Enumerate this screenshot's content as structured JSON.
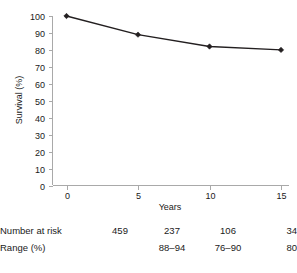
{
  "chart_data": {
    "type": "line",
    "title": "",
    "xlabel": "Years",
    "ylabel": "Survival (%)",
    "x": [
      0,
      5,
      10,
      15
    ],
    "values": [
      100,
      89,
      82,
      80
    ],
    "series": [
      {
        "name": "Survival",
        "values": [
          100,
          89,
          82,
          80
        ]
      }
    ],
    "xlim": [
      0,
      15
    ],
    "ylim": [
      0,
      100
    ],
    "xticks": [
      0,
      5,
      10,
      15
    ],
    "xtick_labels": [
      "0",
      "5",
      "10",
      "15"
    ],
    "yticks": [
      0,
      10,
      20,
      30,
      40,
      50,
      60,
      70,
      80,
      90,
      100
    ],
    "ytick_labels": [
      "0",
      "10",
      "20",
      "30",
      "40",
      "50",
      "60",
      "70",
      "80",
      "90",
      "100"
    ],
    "grid": false,
    "legend": "none",
    "marker": "diamond",
    "line_color": "#231f20",
    "axis_color": "#a9a9a9"
  },
  "risk_table": {
    "rows": [
      {
        "label": "Number at risk",
        "values": [
          "459",
          "237",
          "106",
          "34"
        ]
      },
      {
        "label": "Range (%)",
        "values": [
          "",
          "88–94",
          "76–90",
          "80"
        ]
      }
    ]
  }
}
